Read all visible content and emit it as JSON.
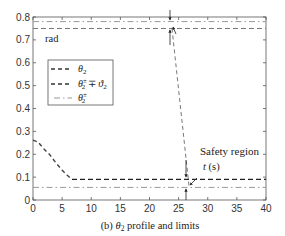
{
  "chart_data": {
    "type": "line",
    "title": "",
    "caption": "(b) θ2 profile and limits",
    "caption_prefix": "(b) ",
    "caption_symbol": "θ",
    "caption_sub": "2",
    "caption_suffix": " profile and limits",
    "xlabel": "t (s)",
    "ylabel": "rad",
    "xlim": [
      0,
      40
    ],
    "ylim": [
      0,
      0.8
    ],
    "xticks": [
      0,
      5,
      10,
      15,
      20,
      25,
      30,
      35,
      40
    ],
    "xtick_labels": [
      "0",
      "5",
      "10",
      "15",
      "20",
      "25",
      "30",
      "35",
      "40"
    ],
    "yticks": [
      0,
      0.1,
      0.2,
      0.3,
      0.4,
      0.5,
      0.6,
      0.7,
      0.8
    ],
    "ytick_labels": [
      "0",
      "0.1",
      "0.2",
      "0.3",
      "0.4",
      "0.5",
      "0.6",
      "0.7",
      "0.8"
    ],
    "grid": false,
    "legend_position": "upper left (inside)",
    "series": [
      {
        "name": "θ2",
        "style": "dashed",
        "x": [
          0,
          1,
          2,
          3,
          4,
          5,
          6,
          7,
          40
        ],
        "values": [
          0.26,
          0.25,
          0.22,
          0.2,
          0.17,
          0.14,
          0.12,
          0.09,
          0.09
        ]
      },
      {
        "name": "θ2± ∓ ϑ2 (upper)",
        "style": "dashed",
        "x": [
          0,
          40
        ],
        "values": [
          0.75,
          0.75
        ]
      },
      {
        "name": "θ2± ∓ ϑ2 (lower)",
        "style": "dashed",
        "x": [
          0,
          40
        ],
        "values": [
          0.09,
          0.09
        ]
      },
      {
        "name": "θ2± (upper)",
        "style": "dash-dot",
        "x": [
          0,
          40
        ],
        "values": [
          0.78,
          0.78
        ]
      },
      {
        "name": "θ2± (lower)",
        "style": "dash-dot",
        "x": [
          0,
          40
        ],
        "values": [
          0.055,
          0.055
        ]
      },
      {
        "name": "transition",
        "style": "dashed-thin",
        "x": [
          24,
          27
        ],
        "values": [
          0.75,
          0.06
        ]
      }
    ],
    "legend": [
      {
        "label_symbol": "θ",
        "label_sub": "2",
        "label_sup": "",
        "label_rest": "",
        "style": "dashed"
      },
      {
        "label_symbol": "θ",
        "label_sub": "2",
        "label_sup": "±",
        "label_rest": " ∓ ϑ",
        "label_rest_sub": "2",
        "style": "dashed"
      },
      {
        "label_symbol": "θ",
        "label_sub": "2",
        "label_sup": "±",
        "label_rest": "",
        "style": "dash-dot"
      }
    ],
    "annotations": [
      {
        "text": "Safety region",
        "x": 32.5,
        "y": 0.14
      },
      {
        "text": "t (s)",
        "x": 30.0,
        "y": 0.115
      },
      {
        "text": "rad",
        "x": 2.0,
        "y": 0.71
      },
      {
        "type": "arrow",
        "from": [
          26.3,
          0.175
        ],
        "to": [
          26.3,
          0.095
        ]
      },
      {
        "type": "arrow",
        "from": [
          26.3,
          0.0
        ],
        "to": [
          26.3,
          0.05
        ]
      },
      {
        "type": "arrow",
        "from": [
          23.5,
          0.72
        ],
        "to": [
          23.5,
          0.755
        ]
      },
      {
        "type": "arrow",
        "from": [
          23.5,
          0.81
        ],
        "to": [
          23.5,
          0.785
        ]
      }
    ]
  }
}
